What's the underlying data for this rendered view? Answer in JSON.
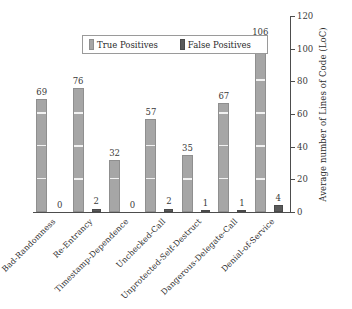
{
  "chart_data": {
    "type": "bar",
    "title": "",
    "xlabel": "",
    "ylabel": "Average number of Lines of Code (LoC)",
    "ylim": [
      0,
      120
    ],
    "yticks": [
      0,
      20,
      40,
      60,
      80,
      100,
      120
    ],
    "grid": false,
    "legend_position": "top-center",
    "categories": [
      "Bad-Randomness",
      "Re-Entrancy",
      "Timestamp-Dependence",
      "Unchecked-Call",
      "Unprotected-Self-Destruct",
      "Dangerous-Delegate-Call",
      "Denial-of-Service"
    ],
    "series": [
      {
        "name": "True Positives",
        "color": "#a6a6a6",
        "values": [
          69,
          76,
          32,
          57,
          35,
          67,
          106
        ]
      },
      {
        "name": "False Positives",
        "color": "#5a5a5a",
        "values": [
          0,
          2,
          0,
          2,
          1,
          1,
          4
        ]
      }
    ]
  },
  "axis": {
    "y_title": "Average number of Lines of Code (LoC)",
    "tick_labels": [
      "0",
      "20",
      "40",
      "60",
      "80",
      "100",
      "120"
    ]
  },
  "legend": {
    "items": [
      {
        "label": "True Positives",
        "swatch": "tp-swatch-icon"
      },
      {
        "label": "False Positives",
        "swatch": "fp-swatch-icon"
      }
    ]
  },
  "value_labels": {
    "true_positives": [
      "69",
      "76",
      "32",
      "57",
      "35",
      "67",
      "106"
    ],
    "false_positives": [
      "0",
      "2",
      "0",
      "2",
      "1",
      "1",
      "4"
    ]
  }
}
